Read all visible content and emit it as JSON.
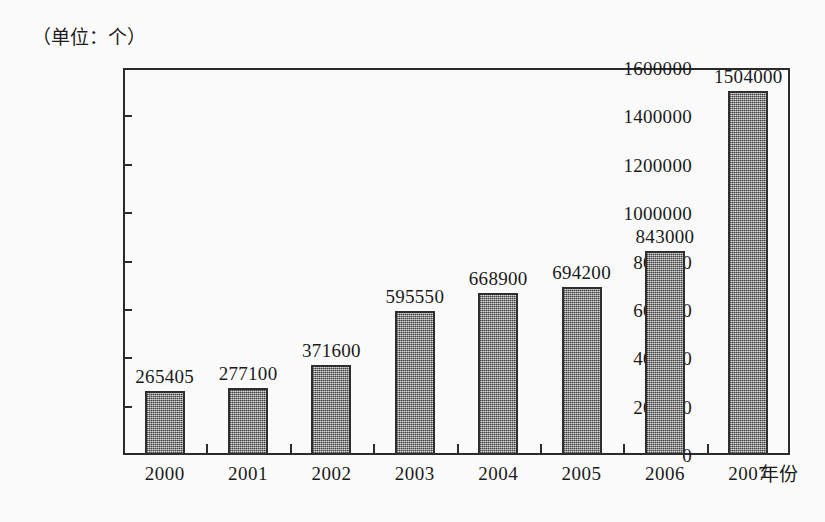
{
  "chart_data": {
    "type": "bar",
    "title": "",
    "subtitle": "",
    "unit_label": "（单位：个）",
    "xlabel": "年份",
    "ylabel": "",
    "categories": [
      "2000",
      "2001",
      "2002",
      "2003",
      "2004",
      "2005",
      "2006",
      "2007"
    ],
    "values": [
      265405,
      277100,
      371600,
      595550,
      668900,
      694200,
      843000,
      1504000
    ],
    "value_labels": [
      "265405",
      "277100",
      "371600",
      "595550",
      "668900",
      "694200",
      "843000",
      "1504000"
    ],
    "ylim": [
      0,
      1600000
    ],
    "ytick_labels": [
      "0",
      "200000",
      "400000",
      "600000",
      "800000",
      "1000000",
      "1200000",
      "1400000",
      "1600000"
    ],
    "ytick_values": [
      0,
      200000,
      400000,
      600000,
      800000,
      1000000,
      1200000,
      1400000,
      1600000
    ],
    "grid": false,
    "legend": false,
    "legend_position": "none",
    "series": [
      {
        "name": "数量",
        "values": [
          265405,
          277100,
          371600,
          595550,
          668900,
          694200,
          843000,
          1504000
        ]
      }
    ],
    "colors": {
      "bar_fill": "#8e8e8e",
      "bar_border": "#2e2e2e",
      "axis": "#2b2b2b",
      "text": "#1a1a1a",
      "background": "#fbfbfb"
    }
  }
}
